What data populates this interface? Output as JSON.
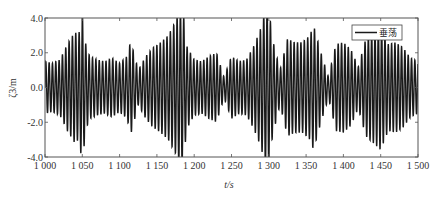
{
  "chart_data": {
    "type": "line",
    "title": "",
    "xlabel": "t/s",
    "ylabel": "ζ3/m",
    "xlim": [
      1000,
      1500
    ],
    "ylim": [
      -4.0,
      4.0
    ],
    "xticks": [
      1000,
      1050,
      1100,
      1150,
      1200,
      1250,
      1300,
      1350,
      1400,
      1450,
      1500
    ],
    "xtick_labels": [
      "1 000",
      "1 050",
      "1 100",
      "1 150",
      "1 200",
      "1 250",
      "1 300",
      "1 350",
      "1 400",
      "1 450",
      "1 500"
    ],
    "yticks": [
      -4.0,
      -2.0,
      0.0,
      2.0,
      4.0
    ],
    "ytick_labels": [
      "-4.0",
      "-2.0",
      "0.0",
      "2.0",
      "4.0"
    ],
    "grid": false,
    "legend": {
      "position": "upper right",
      "entries": [
        "垂荡"
      ]
    },
    "line_color": "#1a1a1a",
    "series": [
      {
        "name": "垂荡",
        "period_s": 4.5,
        "envelope": {
          "t": [
            1000,
            1010,
            1020,
            1030,
            1040,
            1045,
            1050,
            1055,
            1060,
            1070,
            1080,
            1090,
            1100,
            1110,
            1115,
            1125,
            1135,
            1145,
            1155,
            1165,
            1175,
            1180,
            1185,
            1190,
            1200,
            1210,
            1220,
            1230,
            1240,
            1250,
            1260,
            1270,
            1280,
            1290,
            1295,
            1300,
            1305,
            1315,
            1325,
            1335,
            1345,
            1355,
            1360,
            1370,
            1380,
            1390,
            1400,
            1410,
            1420,
            1430,
            1440,
            1450,
            1460,
            1470,
            1480,
            1490,
            1500
          ],
          "amplitude": [
            1.5,
            1.4,
            1.6,
            2.5,
            3.2,
            3.0,
            4.3,
            2.4,
            1.8,
            1.6,
            1.5,
            1.7,
            1.4,
            1.8,
            2.7,
            1.0,
            1.8,
            2.3,
            2.6,
            3.0,
            3.8,
            4.5,
            4.5,
            2.4,
            1.6,
            1.5,
            1.8,
            2.0,
            0.6,
            1.8,
            1.5,
            1.6,
            2.4,
            3.5,
            4.6,
            4.6,
            2.8,
            1.0,
            2.8,
            2.6,
            2.6,
            3.0,
            3.6,
            2.0,
            0.6,
            2.5,
            2.6,
            2.2,
            1.2,
            2.8,
            3.2,
            3.6,
            2.5,
            2.6,
            2.3,
            1.7,
            1.5
          ]
        }
      }
    ]
  }
}
